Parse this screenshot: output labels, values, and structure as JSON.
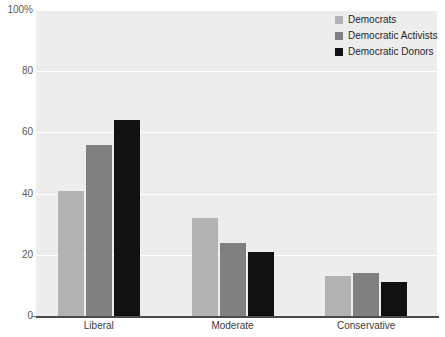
{
  "chart_data": {
    "type": "bar",
    "title": "",
    "subtitle": "",
    "xlabel": "",
    "ylabel": "",
    "categories": [
      "Liberal",
      "Moderate",
      "Conservative"
    ],
    "series": [
      {
        "name": "Democrats",
        "color": "#b3b3b3",
        "values": [
          41,
          32,
          13
        ]
      },
      {
        "name": "Democratic Activists",
        "color": "#808080",
        "values": [
          56,
          24,
          14
        ]
      },
      {
        "name": "Democratic Donors",
        "color": "#111111",
        "values": [
          64,
          21,
          11
        ]
      }
    ],
    "ylim": [
      0,
      100
    ],
    "yticks": [
      0,
      20,
      40,
      60,
      80,
      100
    ],
    "ytick_labels": [
      "0",
      "20",
      "40",
      "60",
      "80",
      "100%"
    ],
    "grid": true,
    "legend_position": "top-right",
    "plot_background": "#ededed",
    "axis_color": "#4a4a4a"
  }
}
